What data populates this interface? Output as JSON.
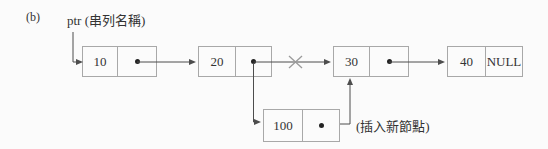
{
  "figure": {
    "label": "(b)",
    "ptr_label": "ptr (串列名稱)",
    "insert_label": "(插入新節點)"
  },
  "colors": {
    "box_border": "#a8a8a8",
    "text": "#333333",
    "arrow": "#4d4d4d",
    "cross": "#9a9a9a",
    "dot": "#222222"
  },
  "icons": {
    "pointer_dot": "●",
    "cross": "×"
  },
  "list": {
    "nodes": [
      {
        "value": "10",
        "pointer": "dot"
      },
      {
        "value": "20",
        "pointer": "dot"
      },
      {
        "value": "30",
        "pointer": "dot"
      },
      {
        "value": "40",
        "pointer": "NULL"
      },
      {
        "value": "100",
        "pointer": "dot"
      }
    ],
    "edges": [
      {
        "from": "ptr",
        "to": "10",
        "status": "active"
      },
      {
        "from": "10",
        "to": "20",
        "status": "active"
      },
      {
        "from": "20",
        "to": "30",
        "status": "crossed-out"
      },
      {
        "from": "20",
        "to": "100",
        "status": "active"
      },
      {
        "from": "100",
        "to": "30",
        "status": "active"
      },
      {
        "from": "30",
        "to": "40",
        "status": "active"
      }
    ]
  }
}
